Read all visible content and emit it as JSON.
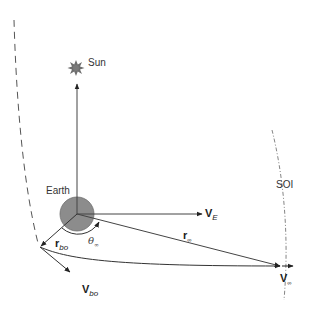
{
  "diagram": {
    "labels": {
      "sun": "Sun",
      "earth": "Earth",
      "soi": "SOI",
      "v_e": {
        "main": "V",
        "sub": "E"
      },
      "r_bo": {
        "main": "r",
        "sub": "bo"
      },
      "v_bo": {
        "main": "V",
        "sub": "bo"
      },
      "r_inf": {
        "main": "r",
        "sub": "∞"
      },
      "v_inf": {
        "main": "V",
        "sub": "∞"
      },
      "theta_inf": {
        "main": "θ",
        "sub": "∞"
      }
    },
    "colors": {
      "earth_fill": "#8c8c8c",
      "earth_stroke": "#6e6e6e",
      "sun_fill": "#6e6e6e",
      "line": "#444444",
      "dashed_curve": "#555555",
      "soi_curve": "#666666"
    }
  }
}
